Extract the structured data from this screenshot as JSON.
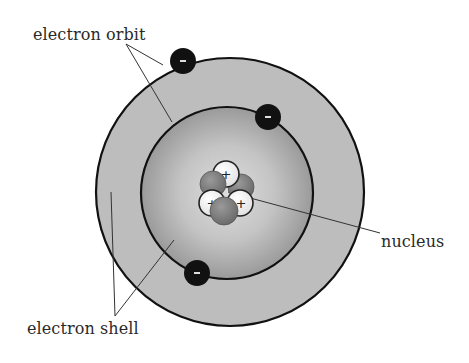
{
  "diagram": {
    "labels": {
      "electron_orbit": "electron orbit",
      "electron_shell": "electron shell",
      "nucleus": "nucleus"
    },
    "electron_symbol": "-",
    "proton_symbol": "+",
    "electrons": [
      {
        "x": 183,
        "y": 61,
        "orbit": "outer"
      },
      {
        "x": 268,
        "y": 117,
        "orbit": "inner"
      },
      {
        "x": 197,
        "y": 273,
        "orbit": "inner"
      }
    ],
    "colors": {
      "outer_shell": "#bdbdbd",
      "inner_shell_center": "#d9d9d9",
      "inner_shell_edge": "#9a9a9a",
      "orbit_line": "#111111",
      "electron": "#111111",
      "proton": "#ffffff",
      "neutron": "#7a7a7a",
      "leader_line": "#333333",
      "text": "#2a2a2a"
    }
  }
}
